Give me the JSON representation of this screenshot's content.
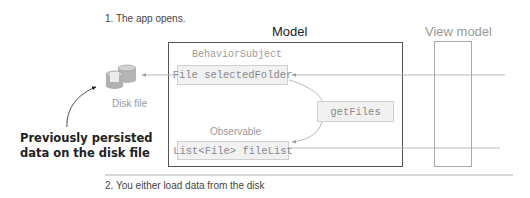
{
  "steps": {
    "step1": "1. The app opens.",
    "step2": "2. You either load data from the disk"
  },
  "columns": {
    "model_title": "Model",
    "viewmodel_title": "View model"
  },
  "disk": {
    "icon": "database-icon",
    "label": "Disk file"
  },
  "callout": {
    "line1": "Previously persisted",
    "line2": "data on the disk file"
  },
  "model": {
    "behavior_subject_label": "BehaviorSubject",
    "selected_folder_field": "File selectedFolder",
    "get_files": "getFiles",
    "observable_label": "Observable",
    "file_list_field": "List<File> fileList"
  },
  "colors": {
    "model_border": "#555555",
    "viewmodel_border": "#aaaaaa",
    "field_bg": "#f1f1f1",
    "arrow": "#999999"
  }
}
